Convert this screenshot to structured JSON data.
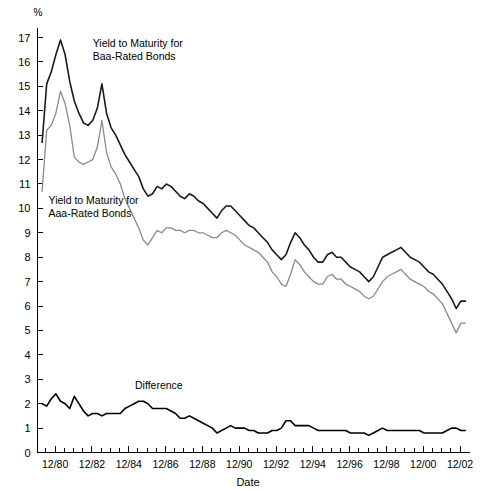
{
  "chart_data": {
    "type": "line",
    "title": "",
    "subtitle": "",
    "xlabel": "Date",
    "ylabel": "%",
    "yunit": "%",
    "grid": false,
    "legend_position": "inline-annotations",
    "ylim": [
      0,
      17
    ],
    "yticks": [
      0,
      1,
      2,
      3,
      4,
      5,
      6,
      7,
      8,
      9,
      10,
      11,
      12,
      13,
      14,
      15,
      16,
      17
    ],
    "ytick_labels": [
      "0",
      "1",
      "2",
      "3",
      "4",
      "5",
      "6",
      "7",
      "8",
      "9",
      "10",
      "11",
      "12",
      "13",
      "14",
      "15",
      "16",
      "17"
    ],
    "xlim": [
      1980.0,
      2003.5
    ],
    "xticks": [
      1980.96,
      1982.96,
      1984.96,
      1986.96,
      1988.96,
      1990.96,
      1992.96,
      1994.96,
      1996.96,
      1998.96,
      2000.96,
      2002.96
    ],
    "xtick_labels": [
      "12/80",
      "12/82",
      "12/84",
      "12/86",
      "12/88",
      "12/90",
      "12/92",
      "12/94",
      "12/96",
      "12/98",
      "12/00",
      "12/02"
    ],
    "x_minor_tick_interval": 0.5,
    "annotations": [
      {
        "id": "baa-label",
        "text": "Yield to Maturity for Baa-Rated Bonds",
        "line1": "Yield to Maturity for",
        "line2": "Baa-Rated Bonds",
        "x": 1983.0,
        "y": 16.6
      },
      {
        "id": "aaa-label",
        "text": "Yield to Maturity for Aaa-Rated Bonds",
        "line1": "Yield to Maturity for",
        "line2": "Aaa-Rated Bonds",
        "x": 1980.6,
        "y": 10.2
      },
      {
        "id": "difference-label",
        "text": "Difference",
        "line1": "Difference",
        "line2": "",
        "x": 1985.3,
        "y": 2.6
      }
    ],
    "x": [
      1980.25,
      1980.5,
      1980.75,
      1981.0,
      1981.25,
      1981.5,
      1981.75,
      1982.0,
      1982.25,
      1982.5,
      1982.75,
      1983.0,
      1983.25,
      1983.5,
      1983.75,
      1984.0,
      1984.25,
      1984.5,
      1984.75,
      1985.0,
      1985.25,
      1985.5,
      1985.75,
      1986.0,
      1986.25,
      1986.5,
      1986.75,
      1987.0,
      1987.25,
      1987.5,
      1987.75,
      1988.0,
      1988.25,
      1988.5,
      1988.75,
      1989.0,
      1989.25,
      1989.5,
      1989.75,
      1990.0,
      1990.25,
      1990.5,
      1990.75,
      1991.0,
      1991.25,
      1991.5,
      1991.75,
      1992.0,
      1992.25,
      1992.5,
      1992.75,
      1993.0,
      1993.25,
      1993.5,
      1993.75,
      1994.0,
      1994.25,
      1994.5,
      1994.75,
      1995.0,
      1995.25,
      1995.5,
      1995.75,
      1996.0,
      1996.25,
      1996.5,
      1996.75,
      1997.0,
      1997.25,
      1997.5,
      1997.75,
      1998.0,
      1998.25,
      1998.5,
      1998.75,
      1999.0,
      1999.25,
      1999.5,
      1999.75,
      2000.0,
      2000.25,
      2000.5,
      2000.75,
      2001.0,
      2001.25,
      2001.5,
      2001.75,
      2002.0,
      2002.25,
      2002.5,
      2002.75,
      2003.0,
      2003.25
    ],
    "series": [
      {
        "name": "Yield to Maturity for Baa-Rated Bonds",
        "key": "baa",
        "color": "#1a1a1a",
        "linewidth": 1.6,
        "values": [
          12.7,
          15.1,
          15.6,
          16.3,
          16.9,
          16.3,
          15.2,
          14.4,
          13.9,
          13.5,
          13.4,
          13.6,
          14.1,
          15.1,
          13.9,
          13.3,
          13.0,
          12.6,
          12.2,
          11.9,
          11.6,
          11.3,
          10.8,
          10.5,
          10.6,
          10.9,
          10.8,
          11.0,
          10.9,
          10.7,
          10.5,
          10.4,
          10.6,
          10.5,
          10.3,
          10.2,
          10.0,
          9.8,
          9.6,
          9.9,
          10.1,
          10.1,
          9.9,
          9.7,
          9.5,
          9.3,
          9.2,
          9.0,
          8.8,
          8.6,
          8.3,
          8.1,
          7.9,
          8.1,
          8.6,
          9.0,
          8.8,
          8.5,
          8.3,
          8.0,
          7.8,
          7.8,
          8.1,
          8.2,
          8.0,
          8.0,
          7.8,
          7.6,
          7.5,
          7.4,
          7.2,
          7.0,
          7.2,
          7.6,
          8.0,
          8.1,
          8.2,
          8.3,
          8.4,
          8.2,
          8.0,
          7.9,
          7.8,
          7.6,
          7.4,
          7.3,
          7.1,
          6.9,
          6.6,
          6.3,
          5.9,
          6.2,
          6.2
        ]
      },
      {
        "name": "Yield to Maturity for Aaa-Rated Bonds",
        "key": "aaa",
        "color": "#8a8a8a",
        "linewidth": 1.3,
        "values": [
          10.7,
          13.2,
          13.4,
          13.9,
          14.8,
          14.3,
          13.4,
          12.1,
          11.9,
          11.8,
          11.9,
          12.0,
          12.5,
          13.6,
          12.3,
          11.7,
          11.4,
          11.0,
          10.4,
          10.0,
          9.6,
          9.2,
          8.7,
          8.5,
          8.8,
          9.1,
          9.0,
          9.2,
          9.2,
          9.1,
          9.1,
          9.0,
          9.1,
          9.1,
          9.0,
          9.0,
          8.9,
          8.8,
          8.8,
          9.0,
          9.1,
          9.0,
          8.9,
          8.7,
          8.5,
          8.4,
          8.3,
          8.2,
          8.0,
          7.8,
          7.4,
          7.2,
          6.9,
          6.8,
          7.3,
          7.9,
          7.7,
          7.4,
          7.2,
          7.0,
          6.9,
          6.9,
          7.2,
          7.3,
          7.1,
          7.1,
          6.9,
          6.8,
          6.7,
          6.6,
          6.4,
          6.3,
          6.4,
          6.7,
          7.0,
          7.2,
          7.3,
          7.4,
          7.5,
          7.3,
          7.1,
          7.0,
          6.9,
          6.8,
          6.6,
          6.5,
          6.3,
          6.1,
          5.7,
          5.3,
          4.9,
          5.3,
          5.3
        ]
      },
      {
        "name": "Difference",
        "key": "difference",
        "color": "#000000",
        "linewidth": 1.6,
        "values": [
          2.0,
          1.9,
          2.2,
          2.4,
          2.1,
          2.0,
          1.8,
          2.3,
          2.0,
          1.7,
          1.5,
          1.6,
          1.6,
          1.5,
          1.6,
          1.6,
          1.6,
          1.6,
          1.8,
          1.9,
          2.0,
          2.1,
          2.1,
          2.0,
          1.8,
          1.8,
          1.8,
          1.8,
          1.7,
          1.6,
          1.4,
          1.4,
          1.5,
          1.4,
          1.3,
          1.2,
          1.1,
          1.0,
          0.8,
          0.9,
          1.0,
          1.1,
          1.0,
          1.0,
          1.0,
          0.9,
          0.9,
          0.8,
          0.8,
          0.8,
          0.9,
          0.9,
          1.0,
          1.3,
          1.3,
          1.1,
          1.1,
          1.1,
          1.1,
          1.0,
          0.9,
          0.9,
          0.9,
          0.9,
          0.9,
          0.9,
          0.9,
          0.8,
          0.8,
          0.8,
          0.8,
          0.7,
          0.8,
          0.9,
          1.0,
          0.9,
          0.9,
          0.9,
          0.9,
          0.9,
          0.9,
          0.9,
          0.9,
          0.8,
          0.8,
          0.8,
          0.8,
          0.8,
          0.9,
          1.0,
          1.0,
          0.9,
          0.9
        ]
      }
    ]
  }
}
